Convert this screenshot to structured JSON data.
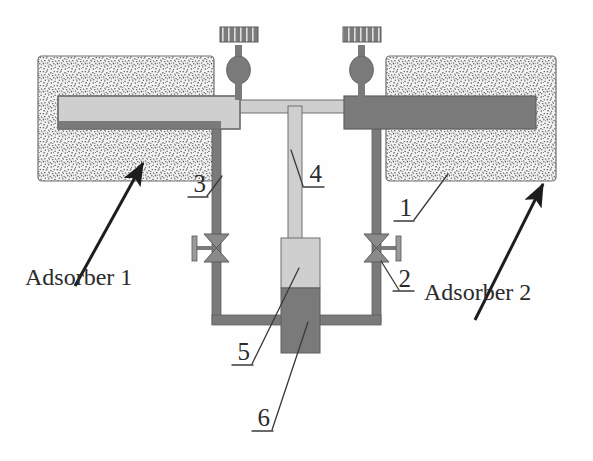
{
  "figure": {
    "background_color": "#fefefe"
  },
  "colors": {
    "stipple_fill": "#f2f2f2",
    "stipple_dot": "#5a5a5a",
    "light_tube": "#cfcfcf",
    "dark_tube": "#7a7a7a",
    "outline": "#6e6e6e",
    "leader_line": "#3a3a3a",
    "arrow": "#1d1d1d",
    "text": "#2b2b2b"
  },
  "components": {
    "adsorber_left": {
      "name": "Adsorber 1",
      "block_label": "adsorber-block-left",
      "tube_state": "light"
    },
    "adsorber_right": {
      "name": "Adsorber 2",
      "block_label": "adsorber-block-right",
      "tube_state": "dark"
    },
    "valve_top_left": {
      "type": "handwheel-valve"
    },
    "valve_top_right": {
      "type": "handwheel-valve"
    },
    "valve_line_left": {
      "type": "bowtie-valve",
      "handle_side": "left"
    },
    "valve_line_right": {
      "type": "bowtie-valve",
      "handle_side": "right"
    },
    "center_vessel": {
      "upper_state": "light",
      "lower_state": "dark"
    }
  },
  "callouts": [
    {
      "id": "1",
      "text": "1",
      "target": "adsorber-block-right"
    },
    {
      "id": "2",
      "text": "2",
      "target": "valve-line-right"
    },
    {
      "id": "3",
      "text": "3",
      "target": "pipe-vertical-left"
    },
    {
      "id": "4",
      "text": "4",
      "target": "pipe-vertical-center"
    },
    {
      "id": "5",
      "text": "5",
      "target": "vessel-upper"
    },
    {
      "id": "6",
      "text": "6",
      "target": "vessel-lower"
    }
  ],
  "labels": {
    "adsorber_1": "Adsorber 1",
    "adsorber_2": "Adsorber 2",
    "n1": "1",
    "n2": "2",
    "n3": "3",
    "n4": "4",
    "n5": "5",
    "n6": "6"
  }
}
